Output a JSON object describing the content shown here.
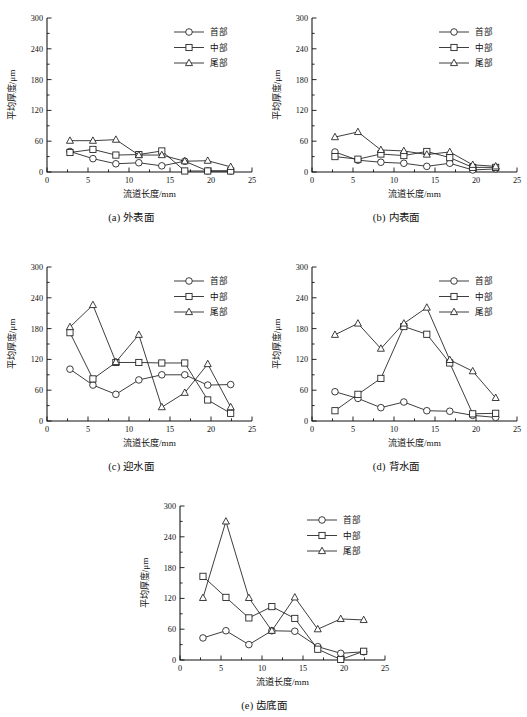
{
  "figure": {
    "axis": {
      "xlabel": "流道长度/mm",
      "ylabel": "平均厚度/μm",
      "xticks": [
        0,
        5,
        10,
        15,
        20,
        25
      ],
      "yticks": [
        0,
        60,
        120,
        180,
        240,
        300
      ],
      "xlim": [
        0,
        25
      ],
      "ylim": [
        0,
        300
      ],
      "grid": false
    },
    "legend": {
      "position": "top-right",
      "entries": [
        {
          "label": "首部",
          "marker": "circle"
        },
        {
          "label": "中部",
          "marker": "square"
        },
        {
          "label": "尾部",
          "marker": "triangle"
        }
      ]
    }
  },
  "chart_data": [
    {
      "id": "a",
      "type": "line",
      "title": "(a) 外表面",
      "xlabel": "流道长度/mm",
      "ylabel": "平均厚度/μm",
      "xlim": [
        0,
        25
      ],
      "ylim": [
        0,
        300
      ],
      "x": [
        2.8,
        5.6,
        8.4,
        11.2,
        14.0,
        16.8,
        19.6,
        22.4
      ],
      "series": [
        {
          "name": "首部",
          "marker": "circle",
          "values": [
            40,
            26,
            16,
            18,
            12,
            21,
            2,
            2
          ]
        },
        {
          "name": "中部",
          "marker": "square",
          "values": [
            38,
            44,
            33,
            34,
            41,
            2,
            2,
            2
          ]
        },
        {
          "name": "尾部",
          "marker": "triangle",
          "values": [
            61,
            61,
            63,
            33,
            33,
            21,
            22,
            10
          ]
        }
      ]
    },
    {
      "id": "b",
      "type": "line",
      "title": "(b) 内表面",
      "xlabel": "流道长度/mm",
      "ylabel": "平均厚度/μm",
      "xlim": [
        0,
        25
      ],
      "ylim": [
        0,
        300
      ],
      "x": [
        2.8,
        5.6,
        8.4,
        11.2,
        14.0,
        16.8,
        19.6,
        22.4
      ],
      "series": [
        {
          "name": "首部",
          "marker": "circle",
          "values": [
            39,
            23,
            19,
            17,
            11,
            17,
            4,
            6
          ]
        },
        {
          "name": "中部",
          "marker": "square",
          "values": [
            30,
            25,
            35,
            32,
            40,
            28,
            9,
            9
          ]
        },
        {
          "name": "尾部",
          "marker": "triangle",
          "values": [
            68,
            78,
            43,
            41,
            34,
            39,
            14,
            11
          ]
        }
      ]
    },
    {
      "id": "c",
      "type": "line",
      "title": "(c) 迎水面",
      "xlabel": "流道长度/mm",
      "ylabel": "平均厚度/μm",
      "xlim": [
        0,
        25
      ],
      "ylim": [
        0,
        300
      ],
      "x": [
        2.8,
        5.6,
        8.4,
        11.2,
        14.0,
        16.8,
        19.6,
        22.4
      ],
      "series": [
        {
          "name": "首部",
          "marker": "circle",
          "values": [
            101,
            70,
            52,
            80,
            90,
            90,
            70,
            71
          ]
        },
        {
          "name": "中部",
          "marker": "square",
          "values": [
            172,
            82,
            114,
            114,
            113,
            113,
            41,
            15
          ]
        },
        {
          "name": "尾部",
          "marker": "triangle",
          "values": [
            183,
            226,
            115,
            168,
            27,
            55,
            111,
            27
          ]
        }
      ]
    },
    {
      "id": "d",
      "type": "line",
      "title": "(d) 背水面",
      "xlabel": "流道长度/mm",
      "ylabel": "平均厚度/μm",
      "xlim": [
        0,
        25
      ],
      "ylim": [
        0,
        300
      ],
      "x": [
        2.8,
        5.6,
        8.4,
        11.2,
        14.0,
        16.8,
        19.6,
        22.4
      ],
      "series": [
        {
          "name": "首部",
          "marker": "circle",
          "values": [
            57,
            44,
            26,
            37,
            20,
            19,
            11,
            7
          ]
        },
        {
          "name": "中部",
          "marker": "square",
          "values": [
            20,
            52,
            83,
            184,
            169,
            113,
            14,
            15
          ]
        },
        {
          "name": "尾部",
          "marker": "triangle",
          "values": [
            168,
            190,
            141,
            190,
            221,
            119,
            97,
            45
          ]
        }
      ]
    },
    {
      "id": "e",
      "type": "line",
      "title": "(e) 齿底面",
      "xlabel": "流道长度/mm",
      "ylabel": "平均厚度/μm",
      "xlim": [
        0,
        25
      ],
      "ylim": [
        0,
        300
      ],
      "x": [
        2.8,
        5.6,
        8.4,
        11.2,
        14.0,
        16.8,
        19.6,
        22.4
      ],
      "series": [
        {
          "name": "首部",
          "marker": "circle",
          "values": [
            43,
            57,
            30,
            57,
            56,
            26,
            13,
            16
          ]
        },
        {
          "name": "中部",
          "marker": "square",
          "values": [
            163,
            122,
            82,
            104,
            81,
            21,
            1,
            17
          ]
        },
        {
          "name": "尾部",
          "marker": "triangle",
          "values": [
            121,
            270,
            121,
            57,
            122,
            60,
            80,
            78
          ]
        }
      ]
    }
  ]
}
